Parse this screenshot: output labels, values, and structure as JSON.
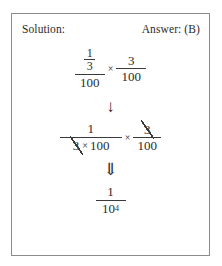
{
  "frame": {
    "border_color": "#8c8c8c",
    "background": "#ffffff"
  },
  "header": {
    "solution_label": "Solution:",
    "answer_label": "Answer: (B)"
  },
  "steps": {
    "step1": {
      "outer_numerator_inner_num": "1",
      "outer_numerator_inner_den": "3",
      "outer_denominator": "100",
      "operator": "×",
      "right_numerator": "3",
      "right_denominator": "100"
    },
    "arrow1": "↓",
    "step2": {
      "left_numerator": "1",
      "left_den_cancelled": "3",
      "left_den_times": "×",
      "left_den_rest": "100",
      "operator": "×",
      "right_numerator_cancelled": "3",
      "right_denominator": "100"
    },
    "arrow2": "⇓",
    "step3": {
      "numerator": "1",
      "denominator_base": "10",
      "denominator_exponent": "4"
    }
  }
}
